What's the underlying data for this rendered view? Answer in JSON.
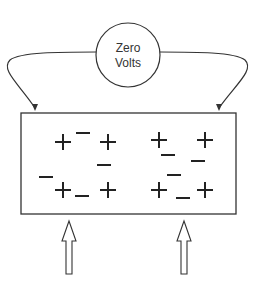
{
  "meter": {
    "label_line1": "Zero",
    "label_line2": "Volts",
    "center": [
      128,
      55
    ],
    "radius": 32
  },
  "plate": {
    "x": 21,
    "y": 113,
    "width": 215,
    "height": 101
  },
  "charges": [
    {
      "sign": "+",
      "x": 63,
      "y": 142
    },
    {
      "sign": "−",
      "x": 83,
      "y": 133
    },
    {
      "sign": "+",
      "x": 108,
      "y": 142
    },
    {
      "sign": "−",
      "x": 104,
      "y": 165
    },
    {
      "sign": "−",
      "x": 46,
      "y": 177
    },
    {
      "sign": "+",
      "x": 63,
      "y": 190
    },
    {
      "sign": "−",
      "x": 82,
      "y": 196
    },
    {
      "sign": "+",
      "x": 108,
      "y": 190
    },
    {
      "sign": "+",
      "x": 159,
      "y": 140
    },
    {
      "sign": "−",
      "x": 168,
      "y": 155
    },
    {
      "sign": "+",
      "x": 205,
      "y": 140
    },
    {
      "sign": "−",
      "x": 198,
      "y": 161
    },
    {
      "sign": "−",
      "x": 174,
      "y": 175
    },
    {
      "sign": "+",
      "x": 159,
      "y": 190
    },
    {
      "sign": "−",
      "x": 183,
      "y": 198
    },
    {
      "sign": "+",
      "x": 205,
      "y": 190
    }
  ],
  "input_arrows": [
    {
      "x": 69
    },
    {
      "x": 184
    }
  ],
  "colors": {
    "stroke": "#333333",
    "background": "#ffffff"
  }
}
